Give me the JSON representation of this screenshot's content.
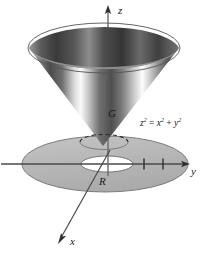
{
  "figure": {
    "background_color": "#ffffff"
  },
  "axes": {
    "z_label": "z",
    "y_label": "y",
    "x_label": "x",
    "tick_count": 2,
    "axis_color": "#4a4a4a"
  },
  "labels": {
    "solid": "G",
    "region": "R",
    "equation_lhs": "z",
    "equation_lhs_exp": "2",
    "equation_op1": " = ",
    "equation_t1": "x",
    "equation_t1_exp": "2",
    "equation_op2": " + ",
    "equation_t2": "y",
    "equation_t2_exp": "2"
  },
  "colors": {
    "disk_fill": "#b9b9b9",
    "disk_edge": "#6e6e6e",
    "hole_fill": "#ffffff",
    "cone_dark": "#3a3a3a",
    "cone_light": "#f2f2f2",
    "rim_dark": "#4a4a4a",
    "axis": "#4a4a4a",
    "text": "#1a1a1a"
  },
  "geometry": {
    "origin_x": 105,
    "origin_y": 163,
    "cone_apex_x": 103,
    "cone_apex_y": 145,
    "cone_top_y": 48,
    "cone_top_half_width": 76,
    "disk_half_width": 83,
    "disk_half_height": 28,
    "hole_half_width": 26,
    "hole_half_height": 8
  }
}
